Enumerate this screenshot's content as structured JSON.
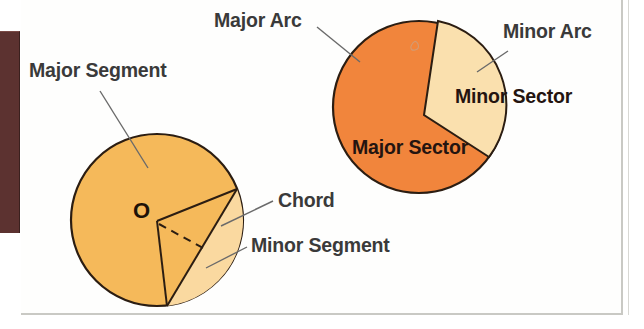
{
  "figure": {
    "colors": {
      "major_segment_fill": "#F5B95A",
      "minor_segment_fill": "#FAD9A0",
      "major_sector_fill": "#F1853C",
      "minor_sector_fill": "#FAE0AE",
      "outline": "#2b1d12",
      "leader_line": "#6a6a6a",
      "label_text": "#3a3a3a",
      "on_figure_text": "#241410",
      "brown_block": "#5c3230",
      "paper": "#fefefd"
    },
    "left_circle": {
      "name": "segments-circle",
      "center_label": "O",
      "cx": 157,
      "cy": 220,
      "r": 86,
      "chord_start_angle_deg": -21,
      "chord_end_angle_deg": 96
    },
    "right_circle": {
      "name": "sectors-circle",
      "cx": 419,
      "cy": 107,
      "r": 86,
      "sector_start_angle_deg": -77,
      "sector_end_angle_deg": 36
    }
  },
  "labels": {
    "major_segment": "Major Segment",
    "major_arc": "Major Arc",
    "minor_arc": "Minor Arc",
    "minor_sector": "Minor Sector",
    "major_sector": "Major Sector",
    "chord": "Chord",
    "minor_segment": "Minor Segment",
    "center_point": "O"
  }
}
